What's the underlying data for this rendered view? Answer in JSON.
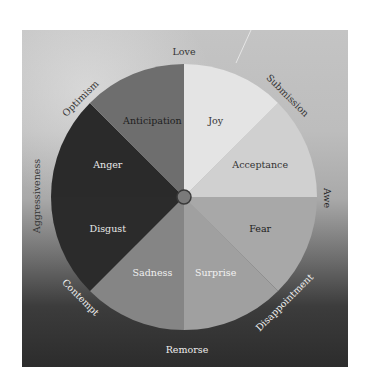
{
  "diagram": {
    "center": {
      "x": 184,
      "y": 197,
      "r": 133
    },
    "primary_emotions": [
      {
        "label": "Joy",
        "color": "#e4e4e4",
        "text_color": "#333333",
        "start": -90,
        "end": -45
      },
      {
        "label": "Acceptance",
        "color": "#d0d0d0",
        "text_color": "#333333",
        "start": -45,
        "end": 0
      },
      {
        "label": "Fear",
        "color": "#a8a8a8",
        "text_color": "#222222",
        "start": 0,
        "end": 45
      },
      {
        "label": "Surprise",
        "color": "#a0a0a0",
        "text_color": "#f2f2f2",
        "start": 45,
        "end": 90
      },
      {
        "label": "Sadness",
        "color": "#858585",
        "text_color": "#f0f0f0",
        "start": 90,
        "end": 135
      },
      {
        "label": "Disgust",
        "color": "#2b2b2b",
        "text_color": "#e8e8e8",
        "start": 135,
        "end": 180
      },
      {
        "label": "Anger",
        "color": "#2a2a2a",
        "text_color": "#e8e8e8",
        "start": 180,
        "end": 225
      },
      {
        "label": "Anticipation",
        "color": "#6e6e6e",
        "text_color": "#1e1e1e",
        "start": 225,
        "end": 270
      }
    ],
    "dyads": [
      {
        "label": "Love",
        "x": 184,
        "y": 52,
        "rotate": 0,
        "color": "#333333"
      },
      {
        "label": "Submission",
        "x": 287,
        "y": 96,
        "rotate": 45,
        "color": "#333333"
      },
      {
        "label": "Awe",
        "x": 326,
        "y": 198,
        "rotate": 90,
        "color": "#222222"
      },
      {
        "label": "Disappointment",
        "x": 285,
        "y": 303,
        "rotate": -45,
        "color": "#eeeeee"
      },
      {
        "label": "Remorse",
        "x": 187,
        "y": 350,
        "rotate": 0,
        "color": "#eeeeee"
      },
      {
        "label": "Contempt",
        "x": 80,
        "y": 298,
        "rotate": 45,
        "color": "#eeeeee"
      },
      {
        "label": "Aggressiveness",
        "x": 37,
        "y": 196,
        "rotate": -90,
        "color": "#333333"
      },
      {
        "label": "Optimism",
        "x": 81,
        "y": 99,
        "rotate": -45,
        "color": "#333333"
      }
    ],
    "hub_color": "#7a7a7a",
    "hub_stroke": "#3a3a3a"
  }
}
